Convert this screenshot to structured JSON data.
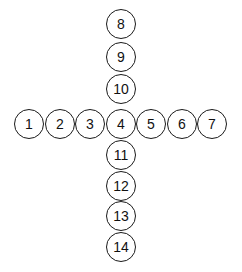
{
  "diagram": {
    "type": "cross-of-numbered-circles",
    "stroke_color": "#1a1a1a",
    "background": "#ffffff",
    "circle_radius": 15,
    "horizontal_row": {
      "y": 124,
      "nodes": [
        {
          "label": "1",
          "x": 29
        },
        {
          "label": "2",
          "x": 60
        },
        {
          "label": "3",
          "x": 90
        },
        {
          "label": "4",
          "x": 121
        },
        {
          "label": "5",
          "x": 151
        },
        {
          "label": "6",
          "x": 182
        },
        {
          "label": "7",
          "x": 212
        }
      ]
    },
    "vertical_column": {
      "x": 121,
      "nodes": [
        {
          "label": "8",
          "y": 24
        },
        {
          "label": "9",
          "y": 57
        },
        {
          "label": "10",
          "y": 89
        },
        {
          "label": "11",
          "y": 155
        },
        {
          "label": "12",
          "y": 186
        },
        {
          "label": "13",
          "y": 216
        },
        {
          "label": "14",
          "y": 247
        }
      ]
    }
  }
}
